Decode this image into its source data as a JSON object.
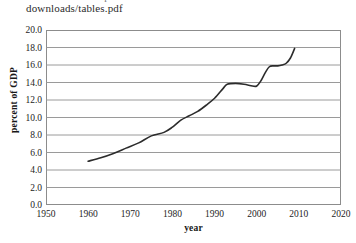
{
  "page": {
    "clipped_top_line": "downloads/tables.pdf",
    "header_text": "downloads/tables.pdf"
  },
  "chart_data": {
    "type": "line",
    "title": "",
    "xlabel": "year",
    "ylabel": "percent of GDP",
    "xlim": [
      1950,
      2020
    ],
    "ylim": [
      0.0,
      20.0
    ],
    "grid": true,
    "legend": false,
    "legend_position": "none",
    "xticks": [
      "1950",
      "1960",
      "1970",
      "1980",
      "1990",
      "2000",
      "2010",
      "2020"
    ],
    "xtick_values": [
      1950,
      1960,
      1970,
      1980,
      1990,
      2000,
      2010,
      2020
    ],
    "yticks": [
      "0.0",
      "2.0",
      "4.0",
      "6.0",
      "8.0",
      "10.0",
      "12.0",
      "14.0",
      "16.0",
      "18.0",
      "20.0"
    ],
    "ytick_values": [
      0.0,
      2.0,
      4.0,
      6.0,
      8.0,
      10.0,
      12.0,
      14.0,
      16.0,
      18.0,
      20.0
    ],
    "line_color": "#2c2c2c",
    "grid_color": "#9a9a9a",
    "series": [
      {
        "name": "health spending",
        "x": [
          1960,
          1963,
          1966,
          1969,
          1972,
          1975,
          1978,
          1980,
          1982,
          1984,
          1986,
          1988,
          1990,
          1992,
          1993,
          1995,
          1997,
          1999,
          2000,
          2001,
          2002,
          2003,
          2004,
          2005,
          2006,
          2007,
          2008,
          2009
        ],
        "y": [
          5.0,
          5.4,
          5.9,
          6.5,
          7.1,
          7.9,
          8.3,
          8.9,
          9.7,
          10.2,
          10.7,
          11.4,
          12.2,
          13.3,
          13.8,
          13.9,
          13.8,
          13.6,
          13.6,
          14.2,
          15.1,
          15.8,
          15.9,
          15.9,
          16.0,
          16.2,
          16.8,
          17.9
        ]
      }
    ]
  }
}
